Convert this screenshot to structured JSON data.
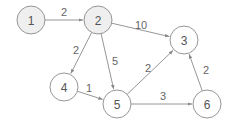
{
  "diagram": {
    "type": "weighted-directed-graph",
    "colors": {
      "edge": "#8a8a8a",
      "node_stroke": "#8a8a8a",
      "visited_fill": "#efefef",
      "default_fill": "#ffffff",
      "text": "#555555"
    },
    "nodes": [
      {
        "id": "1",
        "label": "1",
        "x": 31,
        "y": 20,
        "visited": true
      },
      {
        "id": "2",
        "label": "2",
        "x": 98,
        "y": 20,
        "visited": true
      },
      {
        "id": "3",
        "label": "3",
        "x": 184,
        "y": 40,
        "visited": false
      },
      {
        "id": "4",
        "label": "4",
        "x": 64,
        "y": 87,
        "visited": false
      },
      {
        "id": "5",
        "label": "5",
        "x": 117,
        "y": 104,
        "visited": false
      },
      {
        "id": "6",
        "label": "6",
        "x": 207,
        "y": 104,
        "visited": false
      }
    ],
    "edges": [
      {
        "from": "1",
        "to": "2",
        "weight": "2",
        "lx": 64,
        "ly": 12
      },
      {
        "from": "2",
        "to": "3",
        "weight": "10",
        "lx": 141,
        "ly": 25
      },
      {
        "from": "2",
        "to": "4",
        "weight": "2",
        "lx": 76,
        "ly": 50
      },
      {
        "from": "2",
        "to": "5",
        "weight": "5",
        "lx": 115,
        "ly": 61
      },
      {
        "from": "4",
        "to": "5",
        "weight": "1",
        "lx": 89,
        "ly": 88
      },
      {
        "from": "5",
        "to": "3",
        "weight": "2",
        "lx": 148,
        "ly": 68
      },
      {
        "from": "5",
        "to": "6",
        "weight": "3",
        "lx": 163,
        "ly": 96
      },
      {
        "from": "6",
        "to": "3",
        "weight": "2",
        "lx": 206,
        "ly": 70
      }
    ]
  }
}
